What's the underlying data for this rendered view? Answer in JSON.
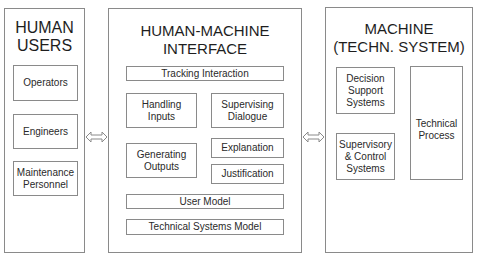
{
  "panels": {
    "human_users": {
      "title": "HUMAN\nUSERS",
      "items": [
        "Operators",
        "Engineers",
        "Maintenance\nPersonnel"
      ]
    },
    "interface": {
      "title": "HUMAN-MACHINE INTERFACE",
      "items": {
        "tracking": "Tracking Interaction",
        "handling": "Handling\nInputs",
        "supervising": "Supervising\nDialogue",
        "generating": "Generating\nOutputs",
        "explanation": "Explanation",
        "justification": "Justification",
        "user_model": "User Model",
        "tech_model": "Technical Systems Model"
      }
    },
    "machine": {
      "title": "MACHINE\n(TECHN. SYSTEM)",
      "items": {
        "decision": "Decision\nSupport\nSystems",
        "supervisory": "Supervisory\n& Control\nSystems",
        "process": "Technical\nProcess"
      }
    }
  },
  "connectors": [
    "bidirectional-arrow users-interface",
    "bidirectional-arrow interface-machine"
  ],
  "colors": {
    "line": "#8a8a8a",
    "text": "#222222",
    "background": "#ffffff"
  }
}
